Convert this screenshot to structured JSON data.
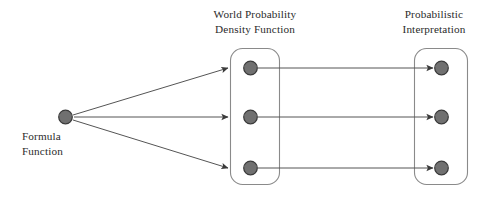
{
  "diagram": {
    "background_color": "#ffffff",
    "node_fill_color": "#707070",
    "node_stroke_color": "#3a3a3a",
    "box_stroke_color": "#8a8a8a",
    "edge_color": "#555555",
    "text_color": "#2b2b2b"
  },
  "source": {
    "name": "formula-function",
    "label_line_1": "Formula",
    "label_line_2": "Function",
    "node_count": 1
  },
  "groups": [
    {
      "name": "world-probability-density-function",
      "label_line_1": "World Probability",
      "label_line_2": "Density Function",
      "node_count": 3
    },
    {
      "name": "probabilistic-interpretation",
      "label_line_1": "Probabilistic",
      "label_line_2": "Interpretation",
      "node_count": 3
    }
  ],
  "edges": {
    "fan_out_count": 3,
    "mapping_count": 3
  }
}
